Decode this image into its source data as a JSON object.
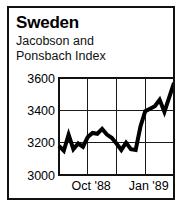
{
  "figure": {
    "title": "Sweden",
    "subtitle_line1": "Jacobson and",
    "subtitle_line2": "Ponsbach Index",
    "border_color": "#111111",
    "background_color": "#ffffff",
    "line_color": "#000000"
  },
  "chart_data": {
    "type": "line",
    "title": "Sweden",
    "subtitle": "Jacobson and Ponsbach Index",
    "xlabel": "",
    "ylabel": "",
    "ylim": [
      3000,
      3600
    ],
    "ytick_labels": [
      "3600",
      "3400",
      "3200",
      "3000"
    ],
    "ytick_values": [
      3600,
      3400,
      3200,
      3000
    ],
    "xtick_labels": [
      "Oct '88",
      "Jan '89"
    ],
    "xtick_positions": [
      0.28,
      0.78
    ],
    "grid": true,
    "grid_vertical_count": 3,
    "grid_horizontal_values": [
      3400,
      3200
    ],
    "legend": "none",
    "series": [
      {
        "name": "Jacobson and Ponsbach Index",
        "x": [
          0,
          1,
          2,
          3,
          4,
          5,
          6,
          7,
          8,
          9,
          10,
          11,
          12,
          13,
          14,
          15,
          16,
          17,
          18,
          19,
          20,
          21,
          22,
          23,
          24
        ],
        "values": [
          3180,
          3150,
          3250,
          3160,
          3195,
          3175,
          3235,
          3260,
          3255,
          3285,
          3250,
          3230,
          3195,
          3155,
          3200,
          3160,
          3155,
          3300,
          3395,
          3410,
          3425,
          3465,
          3390,
          3480,
          3570
        ]
      }
    ]
  }
}
